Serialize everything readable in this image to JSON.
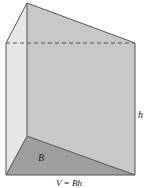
{
  "diagram": {
    "type": "triangular-prism",
    "labels": {
      "base": "B",
      "height": "h",
      "formula": "V = Bh"
    },
    "colors": {
      "front_face": "#c9c9c9",
      "left_face": "#e4e4e4",
      "base_face": "#9c9c9c",
      "edge": "#555555",
      "background": "#ffffff"
    }
  }
}
